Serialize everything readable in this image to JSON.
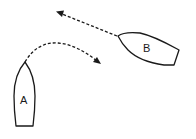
{
  "diagram": {
    "type": "boat-maneuver",
    "boats": [
      {
        "id": "A",
        "label": "A",
        "heading": "north",
        "maneuver": "turning to starboard (curved path right)"
      },
      {
        "id": "B",
        "label": "B",
        "heading": "west-northwest",
        "maneuver": "straight course"
      }
    ],
    "paths": [
      {
        "from": "A",
        "style": "dashed",
        "shape": "curved",
        "arrow": true
      },
      {
        "from": "B",
        "style": "dashed",
        "shape": "straight",
        "arrow": true
      }
    ],
    "colors": {
      "stroke": "#1a1a1a",
      "background": "#ffffff"
    }
  }
}
